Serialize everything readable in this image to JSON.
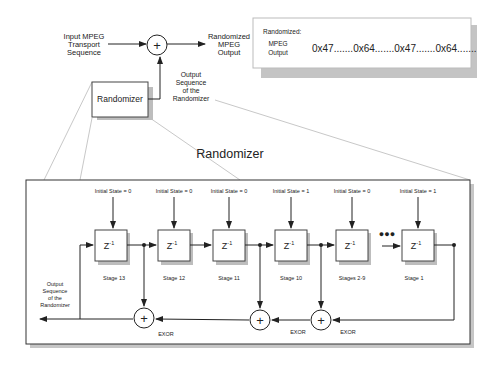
{
  "top_diagram": {
    "input_label": [
      "Input MPEG",
      "Transport",
      "Sequence"
    ],
    "output_label": [
      "Randomized",
      "MPEG",
      "Output"
    ],
    "randomizer_box_label": "Randomizer",
    "feedback_label": [
      "Output",
      "Sequence",
      "of the",
      "Randomizer"
    ],
    "xor_symbol": "+"
  },
  "output_panel": {
    "title": "Randomized:",
    "label": [
      "MPEG",
      "Output"
    ],
    "sequence": "0x47.......0x64.......0x47.......0x64......."
  },
  "detail_title": "Randomizer",
  "stages": [
    {
      "name": "Stage 13",
      "initial_state": "Initial State = 0",
      "symbol": "Z",
      "exp": "-1"
    },
    {
      "name": "Stage 12",
      "initial_state": "Initial State = 0",
      "symbol": "Z",
      "exp": "-1"
    },
    {
      "name": "Stage 11",
      "initial_state": "Initial State = 0",
      "symbol": "Z",
      "exp": "-1"
    },
    {
      "name": "Stage 10",
      "initial_state": "Initial State = 1",
      "symbol": "Z",
      "exp": "-1"
    },
    {
      "name": "Stages 2-9",
      "initial_state": "Initial State = 0",
      "symbol": "Z",
      "exp": "-1"
    },
    {
      "name": "Stage 1",
      "initial_state": "Initial State = 1",
      "symbol": "Z",
      "exp": "-1"
    }
  ],
  "ellipsis": "●●●",
  "xor_labels": [
    "EXOR",
    "EXOR",
    "EXOR"
  ],
  "output_sequence_label": [
    "Output",
    "Sequence",
    "of the",
    "Randomizer"
  ],
  "colors": {
    "line": "#222222",
    "shadow": "#bdbdbd",
    "box_border": "#444444",
    "light_line": "#c8c8c8"
  }
}
